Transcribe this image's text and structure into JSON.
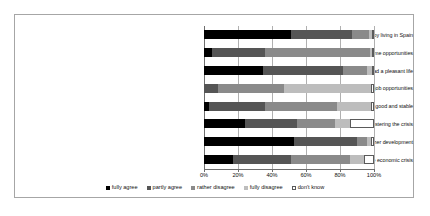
{
  "chart_data": {
    "type": "bar",
    "orientation": "horizontal",
    "stacked": true,
    "normalized_percent": true,
    "title": "",
    "xlabel": "",
    "ylabel": "",
    "xlim": [
      0,
      100
    ],
    "xticks": [
      "0%",
      "20%",
      "40%",
      "60%",
      "80%",
      "100%"
    ],
    "xtick_values": [
      0,
      20,
      40,
      60,
      80,
      100
    ],
    "grid": true,
    "legend_position": "bottom",
    "categories": [
      "I enjoy living in Spain",
      "In Spain, there are good income opportunities",
      "In Spain you can lead a pleasant life",
      "In Spain there are good job opportunities",
      "Living conditions in Spain are good and stable",
      "The EU membership is beneficiary for mastering the crisis",
      "Spain needs reforms for its further development",
      "Spain already passed the peak of the economic crisis"
    ],
    "series": [
      {
        "name": "fully agree",
        "color": "#000000",
        "values": [
          51,
          5,
          35,
          0,
          3,
          24,
          53,
          17
        ]
      },
      {
        "name": "partly agree",
        "color": "#555555",
        "values": [
          36,
          31,
          47,
          8,
          33,
          31,
          37,
          34
        ]
      },
      {
        "name": "rather disagree",
        "color": "#8a8a8a",
        "values": [
          10,
          62,
          14,
          39,
          42,
          22,
          6,
          35
        ]
      },
      {
        "name": "fully disagree",
        "color": "#bdbdbd",
        "values": [
          2,
          1,
          3,
          51,
          20,
          9,
          2,
          8
        ]
      },
      {
        "name": "don't know",
        "color": "#ffffff",
        "values": [
          1,
          1,
          1,
          2,
          2,
          14,
          2,
          6
        ]
      }
    ]
  }
}
